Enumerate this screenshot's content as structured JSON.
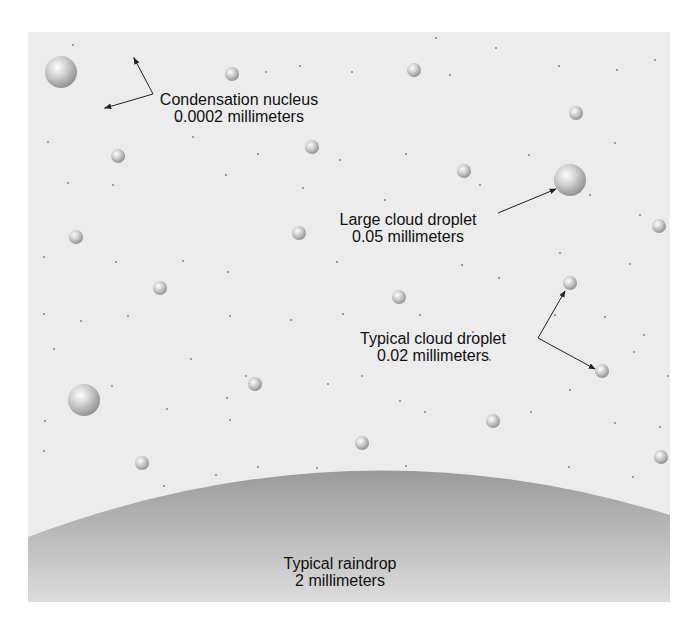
{
  "diagram": {
    "labels": {
      "condensation_nucleus": {
        "name": "Condensation nucleus",
        "size": "0.0002 millimeters"
      },
      "large_cloud_droplet": {
        "name": "Large cloud droplet",
        "size": "0.05 millimeters"
      },
      "typical_cloud_droplet": {
        "name": "Typical cloud droplet",
        "size": "0.02 millimeters"
      },
      "typical_raindrop": {
        "name": "Typical raindrop",
        "size": "2 millimeters"
      }
    },
    "colors": {
      "background": "#ececec",
      "droplet_highlight": "#ffffff",
      "droplet_shadow": "#8c8c8c",
      "raindrop_top": "#9a9a9a",
      "raindrop_bottom": "#dcdcdc",
      "arrow": "#222222"
    },
    "droplets": {
      "large": [
        {
          "x": 61,
          "y": 72,
          "r": 16
        },
        {
          "x": 84,
          "y": 400,
          "r": 16
        },
        {
          "x": 570,
          "y": 180,
          "r": 16
        }
      ],
      "small": [
        {
          "x": 232,
          "y": 74,
          "r": 7
        },
        {
          "x": 414,
          "y": 70,
          "r": 7
        },
        {
          "x": 576,
          "y": 113,
          "r": 7
        },
        {
          "x": 118,
          "y": 156,
          "r": 7
        },
        {
          "x": 312,
          "y": 147,
          "r": 7
        },
        {
          "x": 464,
          "y": 171,
          "r": 7
        },
        {
          "x": 76,
          "y": 237,
          "r": 7
        },
        {
          "x": 299,
          "y": 233,
          "r": 7
        },
        {
          "x": 659,
          "y": 226,
          "r": 7
        },
        {
          "x": 160,
          "y": 288,
          "r": 7
        },
        {
          "x": 399,
          "y": 297,
          "r": 7
        },
        {
          "x": 570,
          "y": 283,
          "r": 7
        },
        {
          "x": 602,
          "y": 371,
          "r": 7
        },
        {
          "x": 255,
          "y": 384,
          "r": 7
        },
        {
          "x": 493,
          "y": 421,
          "r": 7
        },
        {
          "x": 362,
          "y": 443,
          "r": 7
        },
        {
          "x": 142,
          "y": 463,
          "r": 7
        },
        {
          "x": 661,
          "y": 457,
          "r": 7
        }
      ],
      "nuclei": [
        [
          73,
          45
        ],
        [
          134,
          58
        ],
        [
          105,
          108
        ],
        [
          178,
          120
        ],
        [
          266,
          72
        ],
        [
          300,
          66
        ],
        [
          352,
          72
        ],
        [
          436,
          38
        ],
        [
          496,
          48
        ],
        [
          450,
          75
        ],
        [
          559,
          66
        ],
        [
          617,
          70
        ],
        [
          655,
          60
        ],
        [
          48,
          142
        ],
        [
          193,
          137
        ],
        [
          258,
          154
        ],
        [
          340,
          160
        ],
        [
          406,
          154
        ],
        [
          529,
          155
        ],
        [
          615,
          143
        ],
        [
          68,
          183
        ],
        [
          113,
          185
        ],
        [
          226,
          175
        ],
        [
          303,
          188
        ],
        [
          385,
          200
        ],
        [
          480,
          185
        ],
        [
          590,
          195
        ],
        [
          640,
          215
        ],
        [
          44,
          257
        ],
        [
          116,
          262
        ],
        [
          183,
          261
        ],
        [
          228,
          272
        ],
        [
          337,
          262
        ],
        [
          462,
          265
        ],
        [
          499,
          278
        ],
        [
          560,
          253
        ],
        [
          630,
          264
        ],
        [
          44,
          314
        ],
        [
          81,
          321
        ],
        [
          128,
          316
        ],
        [
          230,
          316
        ],
        [
          291,
          320
        ],
        [
          343,
          314
        ],
        [
          420,
          315
        ],
        [
          473,
          332
        ],
        [
          555,
          315
        ],
        [
          605,
          317
        ],
        [
          644,
          335
        ],
        [
          54,
          349
        ],
        [
          191,
          359
        ],
        [
          246,
          376
        ],
        [
          362,
          376
        ],
        [
          450,
          343
        ],
        [
          490,
          360
        ],
        [
          634,
          352
        ],
        [
          668,
          376
        ],
        [
          112,
          386
        ],
        [
          167,
          409
        ],
        [
          227,
          398
        ],
        [
          230,
          420
        ],
        [
          328,
          384
        ],
        [
          400,
          401
        ],
        [
          425,
          412
        ],
        [
          531,
          412
        ],
        [
          570,
          390
        ],
        [
          615,
          423
        ],
        [
          660,
          427
        ],
        [
          45,
          421
        ],
        [
          44,
          451
        ],
        [
          164,
          486
        ],
        [
          216,
          475
        ],
        [
          258,
          467
        ],
        [
          317,
          468
        ],
        [
          406,
          466
        ],
        [
          437,
          486
        ],
        [
          505,
          480
        ],
        [
          569,
          467
        ],
        [
          633,
          477
        ],
        [
          43,
          551
        ],
        [
          205,
          575
        ]
      ]
    },
    "raindrop": {
      "left_y": 537,
      "peak_x": 350,
      "peak_y": 471,
      "right_y": 515
    },
    "arrows": [
      {
        "from": [
          153,
          94
        ],
        "to": [
          134,
          58
        ]
      },
      {
        "from": [
          153,
          94
        ],
        "to": [
          105,
          108
        ]
      },
      {
        "from": [
          498,
          213
        ],
        "to": [
          556,
          189
        ]
      },
      {
        "from": [
          538,
          338
        ],
        "to": [
          565,
          291
        ]
      },
      {
        "from": [
          538,
          338
        ],
        "to": [
          595,
          369
        ]
      }
    ]
  }
}
